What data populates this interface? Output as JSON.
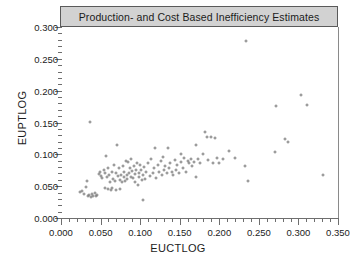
{
  "figure": {
    "title": "Production- and Cost Based Inefficiency Estimates",
    "background_color": "#ffffff",
    "title_bar_color": "#d2d2d2",
    "marker_color": "#7b7b7b",
    "axis_color": "#6e6e6e"
  },
  "chart_data": {
    "type": "scatter",
    "title": "Production- and Cost Based Inefficiency Estimates",
    "xlabel": "EUCTLOG",
    "ylabel": "EUPTLOG",
    "xlim": [
      0.0,
      0.35
    ],
    "ylim": [
      0.0,
      0.3
    ],
    "xticks": [
      0.0,
      0.05,
      0.1,
      0.15,
      0.2,
      0.25,
      0.3,
      0.35
    ],
    "yticks": [
      0.0,
      0.05,
      0.1,
      0.15,
      0.2,
      0.25,
      0.3
    ],
    "xtick_labels": [
      "0.000",
      "0.050",
      "0.100",
      "0.150",
      "0.200",
      "0.250",
      "0.300",
      "0.350"
    ],
    "ytick_labels": [
      "0.000",
      "0.050",
      "0.100",
      "0.150",
      "0.200",
      "0.250",
      "0.300"
    ],
    "minor_tick_interval": 0.01,
    "grid": false,
    "legend": false,
    "marker": "open-circle",
    "n_points": 131,
    "points": [
      [
        0.024,
        0.041
      ],
      [
        0.027,
        0.043
      ],
      [
        0.029,
        0.038
      ],
      [
        0.031,
        0.049
      ],
      [
        0.033,
        0.058
      ],
      [
        0.034,
        0.034
      ],
      [
        0.036,
        0.036
      ],
      [
        0.037,
        0.151
      ],
      [
        0.038,
        0.033
      ],
      [
        0.039,
        0.037
      ],
      [
        0.041,
        0.035
      ],
      [
        0.043,
        0.04
      ],
      [
        0.044,
        0.034
      ],
      [
        0.046,
        0.036
      ],
      [
        0.048,
        0.069
      ],
      [
        0.049,
        0.073
      ],
      [
        0.051,
        0.066
      ],
      [
        0.052,
        0.063
      ],
      [
        0.054,
        0.075
      ],
      [
        0.055,
        0.047
      ],
      [
        0.056,
        0.07
      ],
      [
        0.057,
        0.097
      ],
      [
        0.058,
        0.064
      ],
      [
        0.059,
        0.045
      ],
      [
        0.06,
        0.079
      ],
      [
        0.061,
        0.067
      ],
      [
        0.062,
        0.056
      ],
      [
        0.063,
        0.044
      ],
      [
        0.064,
        0.073
      ],
      [
        0.065,
        0.047
      ],
      [
        0.066,
        0.062
      ],
      [
        0.067,
        0.084
      ],
      [
        0.068,
        0.058
      ],
      [
        0.069,
        0.071
      ],
      [
        0.07,
        0.044
      ],
      [
        0.071,
        0.115
      ],
      [
        0.072,
        0.066
      ],
      [
        0.073,
        0.078
      ],
      [
        0.074,
        0.06
      ],
      [
        0.075,
        0.046
      ],
      [
        0.076,
        0.068
      ],
      [
        0.077,
        0.056
      ],
      [
        0.078,
        0.082
      ],
      [
        0.079,
        0.064
      ],
      [
        0.08,
        0.072
      ],
      [
        0.081,
        0.058
      ],
      [
        0.082,
        0.09
      ],
      [
        0.083,
        0.067
      ],
      [
        0.084,
        0.061
      ],
      [
        0.085,
        0.088
      ],
      [
        0.086,
        0.07
      ],
      [
        0.087,
        0.079
      ],
      [
        0.088,
        0.065
      ],
      [
        0.089,
        0.092
      ],
      [
        0.09,
        0.074
      ],
      [
        0.091,
        0.063
      ],
      [
        0.092,
        0.081
      ],
      [
        0.093,
        0.069
      ],
      [
        0.094,
        0.057
      ],
      [
        0.095,
        0.076
      ],
      [
        0.096,
        0.086
      ],
      [
        0.097,
        0.052
      ],
      [
        0.098,
        0.071
      ],
      [
        0.099,
        0.064
      ],
      [
        0.1,
        0.083
      ],
      [
        0.101,
        0.075
      ],
      [
        0.102,
        0.059
      ],
      [
        0.103,
        0.068
      ],
      [
        0.104,
        0.029
      ],
      [
        0.105,
        0.08
      ],
      [
        0.106,
        0.062
      ],
      [
        0.108,
        0.073
      ],
      [
        0.11,
        0.087
      ],
      [
        0.112,
        0.066
      ],
      [
        0.114,
        0.093
      ],
      [
        0.116,
        0.07
      ],
      [
        0.118,
        0.078
      ],
      [
        0.119,
        0.11
      ],
      [
        0.12,
        0.063
      ],
      [
        0.122,
        0.084
      ],
      [
        0.124,
        0.072
      ],
      [
        0.126,
        0.09
      ],
      [
        0.128,
        0.067
      ],
      [
        0.129,
        0.096
      ],
      [
        0.13,
        0.075
      ],
      [
        0.132,
        0.082
      ],
      [
        0.134,
        0.071
      ],
      [
        0.135,
        0.11
      ],
      [
        0.136,
        0.079
      ],
      [
        0.138,
        0.086
      ],
      [
        0.14,
        0.073
      ],
      [
        0.142,
        0.068
      ],
      [
        0.144,
        0.091
      ],
      [
        0.145,
        0.076
      ],
      [
        0.147,
        0.083
      ],
      [
        0.149,
        0.07
      ],
      [
        0.151,
        0.101
      ],
      [
        0.152,
        0.088
      ],
      [
        0.154,
        0.078
      ],
      [
        0.156,
        0.095
      ],
      [
        0.158,
        0.073
      ],
      [
        0.16,
        0.09
      ],
      [
        0.162,
        0.086
      ],
      [
        0.164,
        0.093
      ],
      [
        0.166,
        0.081
      ],
      [
        0.168,
        0.088
      ],
      [
        0.17,
        0.114
      ],
      [
        0.171,
        0.064
      ],
      [
        0.173,
        0.092
      ],
      [
        0.176,
        0.087
      ],
      [
        0.179,
        0.1
      ],
      [
        0.182,
        0.135
      ],
      [
        0.184,
        0.127
      ],
      [
        0.186,
        0.091
      ],
      [
        0.189,
        0.128
      ],
      [
        0.192,
        0.086
      ],
      [
        0.195,
        0.125
      ],
      [
        0.197,
        0.094
      ],
      [
        0.2,
        0.086
      ],
      [
        0.205,
        0.092
      ],
      [
        0.212,
        0.106
      ],
      [
        0.22,
        0.094
      ],
      [
        0.232,
        0.081
      ],
      [
        0.234,
        0.278
      ],
      [
        0.236,
        0.058
      ],
      [
        0.27,
        0.104
      ],
      [
        0.272,
        0.176
      ],
      [
        0.283,
        0.124
      ],
      [
        0.287,
        0.12
      ],
      [
        0.303,
        0.193
      ],
      [
        0.311,
        0.178
      ],
      [
        0.331,
        0.068
      ]
    ]
  },
  "axes": {
    "x": {
      "label": "EUCTLOG",
      "ticks": [
        "0.000",
        "0.050",
        "0.100",
        "0.150",
        "0.200",
        "0.250",
        "0.300",
        "0.350"
      ]
    },
    "y": {
      "label": "EUPTLOG",
      "ticks": [
        "0.000",
        "0.050",
        "0.100",
        "0.150",
        "0.200",
        "0.250",
        "0.300"
      ]
    }
  }
}
